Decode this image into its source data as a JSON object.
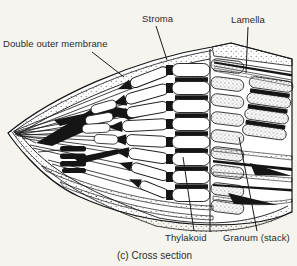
{
  "figure": {
    "type": "textbook-biology-diagram",
    "caption": "(c) Cross section",
    "labels": {
      "stroma": "Stroma",
      "lamella": "Lamella",
      "double_outer_membrane": "Double outer membrane",
      "thylakoid": "Thylakoid",
      "granum": "Granum (stack)"
    },
    "colors": {
      "ink": "#1b1b1b",
      "paper": "#f6f4ef",
      "body_fill": "#ffffff"
    }
  }
}
